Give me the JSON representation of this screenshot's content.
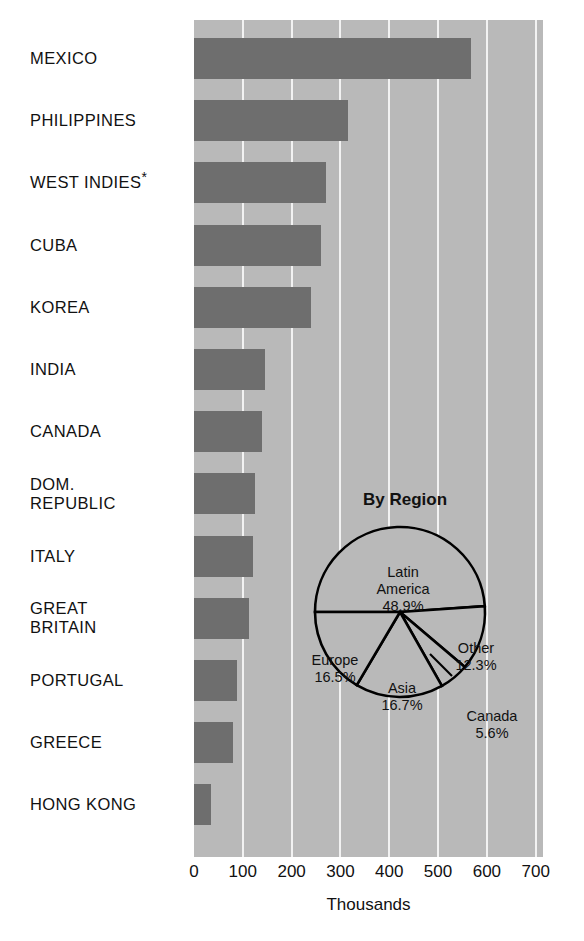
{
  "chart_data": {
    "type": "bar",
    "title": "",
    "xlabel": "Thousands",
    "ylabel": "",
    "xlim": [
      0,
      715
    ],
    "grid": true,
    "unit_note": "values in thousands of immigrants",
    "categories": [
      "MEXICO",
      "PHILIPPINES",
      "WEST INDIES*",
      "CUBA",
      "KOREA",
      "INDIA",
      "CANADA",
      "DOM.\nREPUBLIC",
      "ITALY",
      "GREAT\nBRITAIN",
      "PORTUGAL",
      "GREECE",
      "HONG KONG"
    ],
    "values": [
      567,
      315,
      270,
      260,
      240,
      145,
      140,
      125,
      120,
      112,
      88,
      80,
      35
    ],
    "tick_values": [
      0,
      100,
      200,
      300,
      400,
      500,
      600,
      700
    ],
    "tick_labels": [
      "0",
      "100",
      "200",
      "300",
      "400",
      "500",
      "600",
      "700"
    ],
    "colors": {
      "bar": "#6e6e6e",
      "plot_background": "#b9b9b9",
      "gridline": "#f2f2f2",
      "pie_fill": "#b9b9b9",
      "pie_stroke": "#000000",
      "text": "#111111",
      "page_background": "#ffffff"
    }
  },
  "pie_chart": {
    "type": "pie",
    "title": "By Region",
    "slices": [
      {
        "label": "Latin\nAmerica",
        "value_label": "48.9%",
        "value": 48.9
      },
      {
        "label": "Other",
        "value_label": "12.3%",
        "value": 12.3
      },
      {
        "label": "Canada",
        "value_label": "5.6%",
        "value": 5.6
      },
      {
        "label": "Asia",
        "value_label": "16.7%",
        "value": 16.7
      },
      {
        "label": "Europe",
        "value_label": "16.5%",
        "value": 16.5
      }
    ]
  }
}
